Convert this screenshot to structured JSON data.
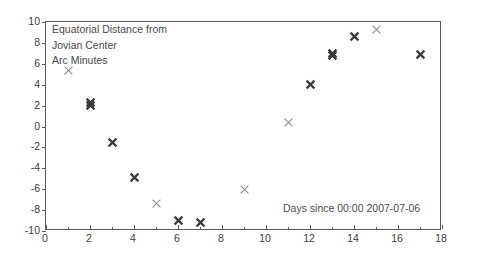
{
  "chart_data": {
    "type": "scatter",
    "title": "",
    "ylabel_lines": [
      "Equatorial Distance from",
      "Jovian Center",
      "Arc Minutes"
    ],
    "xlabel": "Days since 00:00 2007-07-06",
    "xlim": [
      0,
      18
    ],
    "ylim": [
      -10,
      10
    ],
    "xticks": [
      0,
      2,
      4,
      6,
      8,
      10,
      12,
      14,
      16,
      18
    ],
    "xminorticks": [
      1,
      3,
      5,
      7,
      9,
      11,
      13,
      15,
      17
    ],
    "yticks": [
      10,
      8,
      6,
      4,
      2,
      0,
      -2,
      -4,
      -6,
      -8,
      -10
    ],
    "xticklabels": [
      "0",
      "2",
      "4",
      "6",
      "8",
      "10",
      "12",
      "14",
      "16",
      "18"
    ],
    "yticklabels": [
      "10",
      "8",
      "6",
      "4",
      "2",
      "0",
      "-2",
      "-4",
      "-6",
      "-8",
      "-10"
    ],
    "grid": false,
    "legend": "none",
    "marker": "x",
    "marker_color": "#3a3a3a",
    "points": [
      {
        "x": 1,
        "y": 5.4,
        "weight": "light"
      },
      {
        "x": 2,
        "y": 2.3,
        "weight": "bold"
      },
      {
        "x": 2,
        "y": 2.0,
        "weight": "bold"
      },
      {
        "x": 3,
        "y": -1.5,
        "weight": "bold"
      },
      {
        "x": 4,
        "y": -4.9,
        "weight": "bold"
      },
      {
        "x": 5,
        "y": -7.4,
        "weight": "light"
      },
      {
        "x": 6,
        "y": -9.0,
        "weight": "bold"
      },
      {
        "x": 7,
        "y": -9.2,
        "weight": "bold"
      },
      {
        "x": 9,
        "y": -6.0,
        "weight": "light"
      },
      {
        "x": 11,
        "y": 0.4,
        "weight": "light"
      },
      {
        "x": 12,
        "y": 4.0,
        "weight": "bold"
      },
      {
        "x": 13,
        "y": 6.8,
        "weight": "bold"
      },
      {
        "x": 13,
        "y": 7.0,
        "weight": "bold"
      },
      {
        "x": 14,
        "y": 8.6,
        "weight": "bold"
      },
      {
        "x": 15,
        "y": 9.3,
        "weight": "light"
      },
      {
        "x": 17,
        "y": 6.9,
        "weight": "bold"
      }
    ]
  }
}
